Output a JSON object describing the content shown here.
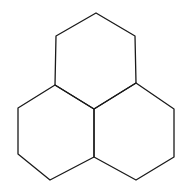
{
  "diagram": {
    "type": "fused-hexagon-structure",
    "stroke_color": "#1a1a1a",
    "background": "#ffffff",
    "vertices": {
      "top": [
        96,
        13
      ],
      "upper_left": [
        56,
        36
      ],
      "upper_right": [
        135,
        40
      ],
      "left_junction": [
        55,
        85
      ],
      "right_junction": [
        136,
        83
      ],
      "center": [
        94,
        109
      ],
      "left_outer_top": [
        18,
        108
      ],
      "left_outer_bottom": [
        18,
        154
      ],
      "left_bottom": [
        50,
        180
      ],
      "bottom_center": [
        94,
        157
      ],
      "right_bottom": [
        136,
        180
      ],
      "right_outer_bottom": [
        174,
        157
      ],
      "right_outer_top": [
        174,
        112
      ]
    },
    "hexagons": [
      {
        "name": "top-hexagon",
        "points": "96,13 135,36 136,83 94,109 55,85 56,36"
      },
      {
        "name": "left-hexagon",
        "points": "55,85 94,109 94,157 50,180 18,154 18,108"
      },
      {
        "name": "right-hexagon",
        "points": "136,83 174,109 174,157 136,180 94,157 94,109"
      }
    ]
  }
}
